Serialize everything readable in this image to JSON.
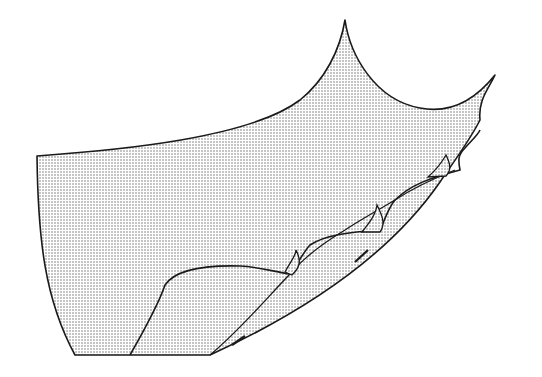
{
  "figure": {
    "stroke_color": "#1a1a1a",
    "fill_dot_color": "#7a7a7a",
    "background": "#ffffff"
  }
}
